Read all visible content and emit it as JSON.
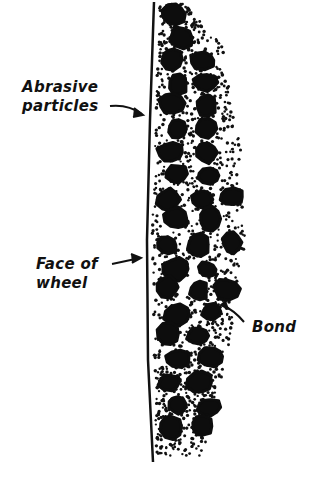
{
  "diagram": {
    "labels": {
      "abrasive_line1": "Abrasive",
      "abrasive_line2": "particles",
      "face_line1": "Face of",
      "face_line2": "wheel",
      "bond": "Bond"
    },
    "colors": {
      "ink": "#111111",
      "background": "#ffffff"
    }
  }
}
